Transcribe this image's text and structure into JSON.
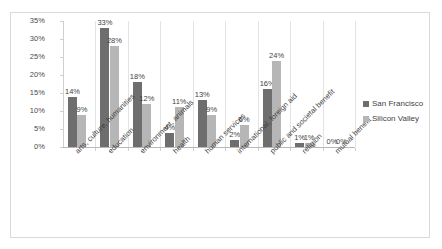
{
  "chart_data": {
    "type": "bar",
    "title": "",
    "subtitle": "",
    "xlabel": "",
    "ylabel": "",
    "ylim": [
      0,
      35
    ],
    "ytick_labels": [
      "35%",
      "30%",
      "25%",
      "20%",
      "15%",
      "10%",
      "5%",
      "0%"
    ],
    "ytick_values": [
      35,
      30,
      25,
      20,
      15,
      10,
      5,
      0
    ],
    "grid": false,
    "legend_position": "right",
    "value_suffix": "%",
    "categories": [
      "arts, culture, humanities",
      "education",
      "environment, animals",
      "health",
      "human services",
      "international, foreign aid",
      "public and societal benefit",
      "religion",
      "mutual benefit"
    ],
    "series": [
      {
        "name": "San Francisco",
        "color": "#6e6e6e",
        "values": [
          14,
          33,
          18,
          4,
          13,
          2,
          16,
          1,
          0
        ],
        "labels": [
          "14%",
          "33%",
          "18%",
          "4%",
          "13%",
          "2%",
          "16%",
          "1%",
          "0%"
        ]
      },
      {
        "name": "Silicon Valley",
        "color": "#b6b6b6",
        "values": [
          9,
          28,
          12,
          11,
          9,
          6,
          24,
          1,
          0
        ],
        "labels": [
          "9%",
          "28%",
          "12%",
          "11%",
          "9%",
          "6%",
          "24%",
          "1%",
          "0%"
        ]
      }
    ]
  },
  "legend": {
    "items": [
      {
        "label": "San Francisco",
        "color": "#6e6e6e"
      },
      {
        "label": "Silicon Valley",
        "color": "#b6b6b6"
      }
    ]
  },
  "colors": {
    "san_francisco": "#6e6e6e",
    "silicon_valley": "#b6b6b6",
    "axis": "#cfcfcf",
    "border": "#d9d9d9",
    "text": "#3f3f3f"
  }
}
